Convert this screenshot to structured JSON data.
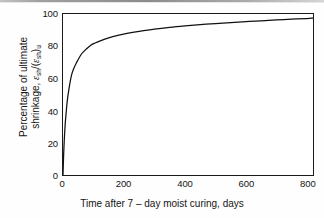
{
  "figure": {
    "background_color": "#fefefe",
    "axis_color": "#1a1a1a",
    "curve_color": "#111111"
  },
  "chart_data": {
    "type": "line",
    "title": "",
    "subtitle": "",
    "xlabel": "Time after 7 – day moist curing, days",
    "ylabel_line1": "Percentage of ultimate",
    "ylabel_line2_prefix": "shrinkage, ",
    "ylabel_symbol_numerator": "ε",
    "ylabel_symbol_numerator_sub": "sh",
    "ylabel_symbol_divider": "/(",
    "ylabel_symbol_denominator": "ε",
    "ylabel_symbol_denominator_sub": "sh",
    "ylabel_symbol_close": ")",
    "ylabel_symbol_close_sub": "u",
    "xlim": [
      0,
      820
    ],
    "ylim": [
      0,
      100
    ],
    "xticks": [
      0,
      200,
      400,
      600,
      800
    ],
    "yticks": [
      0,
      20,
      40,
      60,
      80,
      100
    ],
    "xticklabels": [
      "0",
      "200",
      "400",
      "600",
      "800"
    ],
    "yticklabels": [
      "0",
      "20",
      "40",
      "60",
      "80",
      "100"
    ],
    "grid": false,
    "legend": null,
    "tick_direction": "in",
    "series": [
      {
        "name": "shrinkage-development",
        "x": [
          0,
          2,
          4,
          7,
          10,
          14,
          20,
          28,
          35,
          45,
          60,
          75,
          90,
          105,
          120,
          150,
          180,
          210,
          250,
          300,
          350,
          400,
          450,
          500,
          550,
          600,
          650,
          700,
          750,
          800,
          820
        ],
        "y": [
          0,
          12,
          21,
          31,
          38,
          46,
          54,
          62,
          66,
          70,
          75,
          78,
          80.5,
          82,
          83.2,
          85.2,
          86.7,
          87.9,
          89.2,
          90.6,
          91.7,
          92.6,
          93.4,
          94.1,
          94.7,
          95.3,
          95.8,
          96.3,
          96.8,
          97.2,
          97.4
        ]
      }
    ],
    "annotations": []
  }
}
